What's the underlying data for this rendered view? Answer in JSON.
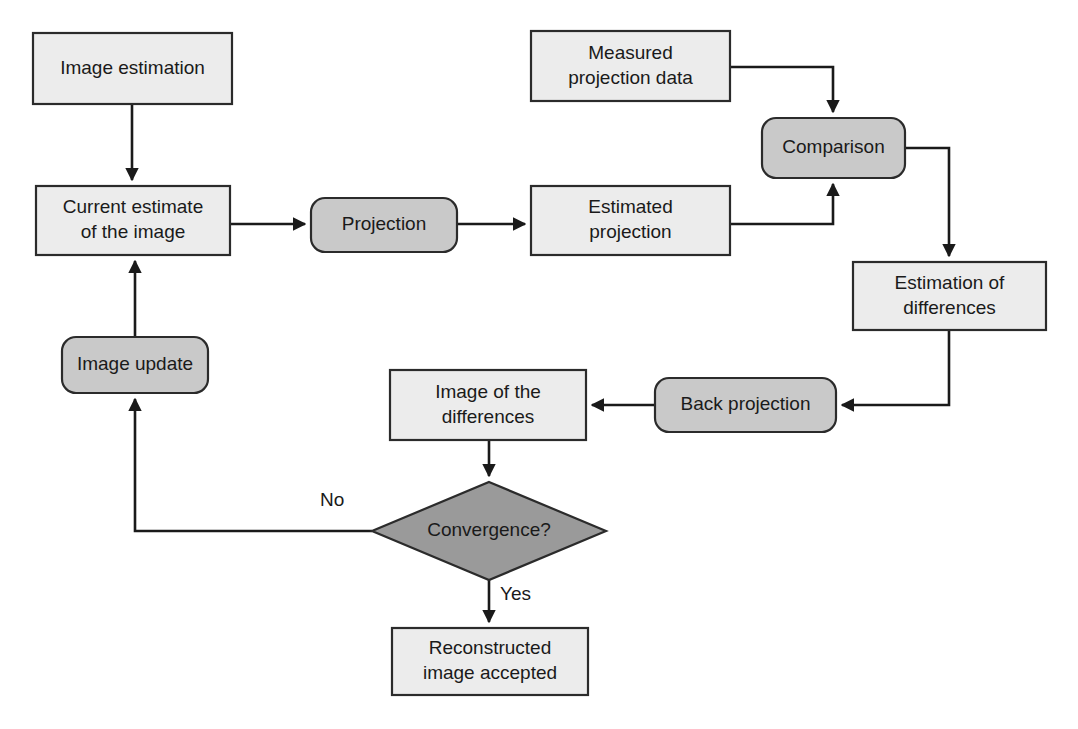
{
  "diagram": {
    "colors": {
      "process_fill": "#ececec",
      "operation_fill": "#c9c9c9",
      "decision_fill": "#9a9a9a",
      "stroke": "#2b2b2b",
      "connector": "#1a1a1a",
      "background": "#ffffff"
    },
    "nodes": [
      {
        "id": "image-estimation",
        "shape": "rectangle",
        "label": "Image estimation",
        "lines": [
          "Image estimation"
        ],
        "x": 33,
        "y": 33,
        "w": 199,
        "h": 71
      },
      {
        "id": "current-estimate",
        "shape": "rectangle",
        "label": "Current estimate of the image",
        "lines": [
          "Current estimate",
          "of the image"
        ],
        "x": 36,
        "y": 186,
        "w": 194,
        "h": 69
      },
      {
        "id": "projection",
        "shape": "rounded-rectangle",
        "label": "Projection",
        "lines": [
          "Projection"
        ],
        "x": 311,
        "y": 198,
        "w": 146,
        "h": 54
      },
      {
        "id": "estimated-projection",
        "shape": "rectangle",
        "label": "Estimated projection",
        "lines": [
          "Estimated",
          "projection"
        ],
        "x": 531,
        "y": 186,
        "w": 199,
        "h": 69
      },
      {
        "id": "measured-projection-data",
        "shape": "rectangle",
        "label": "Measured projection data",
        "lines": [
          "Measured",
          "projection data"
        ],
        "x": 531,
        "y": 31,
        "w": 199,
        "h": 70
      },
      {
        "id": "comparison",
        "shape": "rounded-rectangle",
        "label": "Comparison",
        "lines": [
          "Comparison"
        ],
        "x": 762,
        "y": 118,
        "w": 143,
        "h": 60
      },
      {
        "id": "estimation-of-differences",
        "shape": "rectangle",
        "label": "Estimation of differences",
        "lines": [
          "Estimation of",
          "differences"
        ],
        "x": 853,
        "y": 262,
        "w": 193,
        "h": 68
      },
      {
        "id": "back-projection",
        "shape": "rounded-rectangle",
        "label": "Back projection",
        "lines": [
          "Back projection"
        ],
        "x": 655,
        "y": 378,
        "w": 181,
        "h": 54
      },
      {
        "id": "image-of-differences",
        "shape": "rectangle",
        "label": "Image of the differences",
        "lines": [
          "Image of the",
          "differences"
        ],
        "x": 390,
        "y": 370,
        "w": 196,
        "h": 70
      },
      {
        "id": "convergence",
        "shape": "diamond",
        "label": "Convergence?",
        "lines": [
          "Convergence?"
        ],
        "x": 372,
        "y": 482,
        "w": 234,
        "h": 98
      },
      {
        "id": "image-update",
        "shape": "rounded-rectangle",
        "label": "Image update",
        "lines": [
          "Image update"
        ],
        "x": 62,
        "y": 337,
        "w": 146,
        "h": 56
      },
      {
        "id": "reconstructed-image-accepted",
        "shape": "rectangle",
        "label": "Reconstructed image accepted",
        "lines": [
          "Reconstructed",
          "image accepted"
        ],
        "x": 392,
        "y": 628,
        "w": 196,
        "h": 67
      }
    ],
    "edge_labels": [
      {
        "id": "no-label",
        "text": "No",
        "x": 320,
        "y": 506
      },
      {
        "id": "yes-label",
        "text": "Yes",
        "x": 500,
        "y": 600
      }
    ],
    "edges": [
      {
        "id": "image-estimation-to-current-estimate",
        "from": "image-estimation",
        "to": "current-estimate",
        "path": "M132,104 L132,180"
      },
      {
        "id": "current-estimate-to-projection",
        "from": "current-estimate",
        "to": "projection",
        "path": "M230,224 L305,224"
      },
      {
        "id": "projection-to-estimated-projection",
        "from": "projection",
        "to": "estimated-projection",
        "path": "M457,224 L525,224"
      },
      {
        "id": "measured-projection-data-to-comparison",
        "from": "measured-projection-data",
        "to": "comparison",
        "path": "M730,67 L833,67 L833,112"
      },
      {
        "id": "estimated-projection-to-comparison",
        "from": "estimated-projection",
        "to": "comparison",
        "path": "M730,224 L833,224 L833,184"
      },
      {
        "id": "comparison-to-estimation-of-differences",
        "from": "comparison",
        "to": "estimation-of-differences",
        "path": "M905,148 L949,148 L949,256"
      },
      {
        "id": "estimation-of-differences-to-back-projection",
        "from": "estimation-of-differences",
        "to": "back-projection",
        "path": "M949,330 L949,405 L842,405"
      },
      {
        "id": "back-projection-to-image-of-differences",
        "from": "back-projection",
        "to": "image-of-differences",
        "path": "M655,405 L592,405"
      },
      {
        "id": "image-of-differences-to-convergence",
        "from": "image-of-differences",
        "to": "convergence",
        "path": "M489,440 L489,476"
      },
      {
        "id": "convergence-no-to-image-update",
        "from": "convergence",
        "to": "image-update",
        "path": "M372,531 L135,531 L135,399"
      },
      {
        "id": "image-update-to-current-estimate",
        "from": "image-update",
        "to": "current-estimate",
        "path": "M135,337 L135,261"
      },
      {
        "id": "convergence-yes-to-reconstructed",
        "from": "convergence",
        "to": "reconstructed-image-accepted",
        "path": "M489,580 L489,622"
      }
    ]
  }
}
